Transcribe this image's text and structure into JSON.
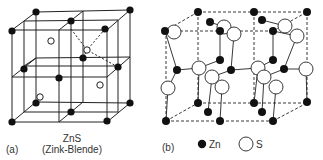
{
  "panel_a": {
    "label": "(a)",
    "title": "ZnS",
    "subtitle": "(Zink-Blende)"
  },
  "panel_b": {
    "label": "(b)",
    "legend": [
      {
        "symbol": "filled-circle",
        "text": "Zn"
      },
      {
        "symbol": "open-circle",
        "text": "S"
      }
    ]
  },
  "colors": {
    "atom_fill": "#111111",
    "line": "#222222",
    "open_atom_fill": "#ffffff"
  }
}
